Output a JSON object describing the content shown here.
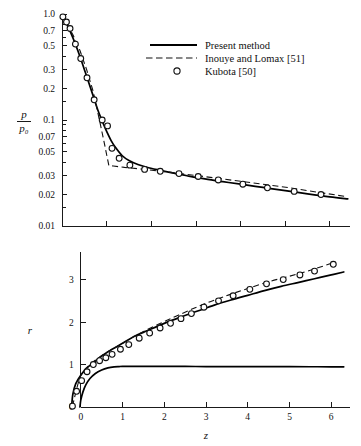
{
  "figure": {
    "legend": {
      "items": [
        {
          "label": "Present method",
          "style": "solid-line"
        },
        {
          "label": "Inouye and Lomax [51]",
          "style": "dashed-line"
        },
        {
          "label": "Kubota [50]",
          "style": "open-circle"
        }
      ]
    }
  },
  "chart_data": [
    {
      "id": "pressure-ratio-chart",
      "type": "line",
      "title": "",
      "xlabel": "",
      "ylabel": "p/p₀",
      "ylabel_numerator": "p",
      "ylabel_denominator": "p₀",
      "xscale": "linear",
      "yscale": "log",
      "xlim": [
        0,
        6.45
      ],
      "ylim": [
        0.01,
        1.0
      ],
      "grid": false,
      "xticks": [
        0,
        1,
        2,
        3,
        4,
        5,
        6
      ],
      "xticklabels": [
        "",
        "",
        "",
        "",
        "",
        "",
        ""
      ],
      "yticks": [
        1.0,
        0.7,
        0.5,
        0.3,
        0.2,
        0.1,
        0.07,
        0.05,
        0.03,
        0.02,
        0.01
      ],
      "yticklabels": [
        "1.0",
        "0.7",
        "0.5",
        "0.3",
        "0.2",
        "0.1",
        "0.07",
        "0.05",
        "0.03",
        "0.02",
        "0.01"
      ],
      "legend_position": "upper-right",
      "series": [
        {
          "name": "Present method",
          "type": "line",
          "style": "solid",
          "x": [
            0.0,
            0.05,
            0.12,
            0.2,
            0.3,
            0.4,
            0.5,
            0.6,
            0.7,
            0.8,
            0.9,
            1.0,
            1.1,
            1.2,
            1.35,
            1.5,
            1.7,
            1.9,
            2.2,
            2.5,
            2.8,
            3.2,
            3.6,
            4.0,
            4.5,
            5.0,
            5.5,
            6.0,
            6.4
          ],
          "y": [
            0.98,
            0.9,
            0.78,
            0.66,
            0.52,
            0.4,
            0.3,
            0.225,
            0.168,
            0.125,
            0.098,
            0.078,
            0.064,
            0.055,
            0.046,
            0.0415,
            0.038,
            0.0358,
            0.0335,
            0.0315,
            0.0298,
            0.0278,
            0.0262,
            0.0248,
            0.0231,
            0.0216,
            0.0201,
            0.0188,
            0.018
          ]
        },
        {
          "name": "Inouye and Lomax [51]",
          "type": "line",
          "style": "dashed",
          "x": [
            0.0,
            0.1,
            0.25,
            0.4,
            0.55,
            0.7,
            0.85,
            0.95,
            1.0,
            1.05,
            1.15,
            1.4,
            1.8,
            2.3,
            2.8,
            3.4,
            4.0,
            4.6,
            5.2,
            5.8,
            6.35
          ],
          "y": [
            0.97,
            0.83,
            0.63,
            0.455,
            0.3,
            0.185,
            0.095,
            0.06,
            0.047,
            0.0372,
            0.0368,
            0.0357,
            0.0344,
            0.0326,
            0.0307,
            0.0285,
            0.0264,
            0.0245,
            0.0226,
            0.0206,
            0.019
          ]
        },
        {
          "name": "Kubota [50]",
          "type": "scatter",
          "style": "open-circle",
          "x": [
            0.02,
            0.1,
            0.18,
            0.3,
            0.42,
            0.56,
            0.72,
            0.9,
            1.02,
            1.12,
            1.28,
            1.52,
            1.85,
            2.2,
            2.62,
            3.05,
            3.5,
            4.05,
            4.6,
            5.2,
            5.8
          ],
          "y": [
            0.94,
            0.84,
            0.73,
            0.52,
            0.38,
            0.25,
            0.155,
            0.1,
            0.088,
            0.054,
            0.0435,
            0.0375,
            0.0342,
            0.0328,
            0.0312,
            0.0293,
            0.0272,
            0.0248,
            0.0229,
            0.0212,
            0.0198
          ]
        }
      ]
    },
    {
      "id": "shock-radius-chart",
      "type": "line",
      "title": "",
      "xlabel": "z",
      "ylabel": "r",
      "xscale": "linear",
      "yscale": "linear",
      "xlim": [
        -0.45,
        6.45
      ],
      "ylim": [
        0,
        3.65
      ],
      "grid": false,
      "xticks": [
        0,
        1,
        2,
        3,
        4,
        5,
        6
      ],
      "xticklabels": [
        "0",
        "1",
        "2",
        "3",
        "4",
        "5",
        "6"
      ],
      "yticks": [
        0,
        1,
        2,
        3
      ],
      "yticklabels": [
        "0",
        "1",
        "2",
        "3"
      ],
      "legend_position": "none",
      "series": [
        {
          "name": "Present method (shock)",
          "type": "line",
          "style": "solid",
          "x": [
            -0.22,
            -0.19,
            -0.12,
            0.0,
            0.15,
            0.3,
            0.5,
            0.75,
            1.0,
            1.3,
            1.6,
            2.0,
            2.4,
            2.8,
            3.2,
            3.6,
            4.0,
            4.4,
            4.8,
            5.2,
            5.6,
            6.0,
            6.3
          ],
          "y": [
            0.0,
            0.3,
            0.55,
            0.75,
            0.92,
            1.04,
            1.2,
            1.36,
            1.5,
            1.67,
            1.8,
            1.97,
            2.12,
            2.26,
            2.4,
            2.52,
            2.63,
            2.74,
            2.84,
            2.93,
            3.02,
            3.11,
            3.18
          ]
        },
        {
          "name": "Present method (body)",
          "type": "line",
          "style": "solid",
          "x": [
            -0.02,
            0.0,
            0.05,
            0.12,
            0.22,
            0.35,
            0.5,
            0.65,
            0.8,
            0.92,
            1.0,
            1.5,
            2.0,
            2.5,
            3.0,
            3.5,
            4.0,
            4.5,
            5.0,
            5.5,
            6.0,
            6.3
          ],
          "y": [
            0.0,
            0.16,
            0.35,
            0.52,
            0.67,
            0.79,
            0.87,
            0.92,
            0.945,
            0.952,
            0.955,
            0.955,
            0.955,
            0.955,
            0.953,
            0.952,
            0.951,
            0.95,
            0.949,
            0.948,
            0.947,
            0.946
          ]
        },
        {
          "name": "Inouye and Lomax [51]",
          "type": "line",
          "style": "dashed",
          "x": [
            -0.2,
            0.0,
            0.25,
            0.55,
            0.9,
            1.3,
            1.75,
            2.2,
            2.65,
            3.1,
            3.55,
            4.0,
            4.5,
            5.0,
            5.5,
            6.05
          ],
          "y": [
            0.02,
            0.74,
            1.02,
            1.24,
            1.44,
            1.67,
            1.9,
            2.1,
            2.3,
            2.48,
            2.64,
            2.79,
            2.95,
            3.08,
            3.22,
            3.4
          ]
        },
        {
          "name": "Kubota [50]",
          "type": "scatter",
          "style": "open-circle",
          "x": [
            -0.2,
            -0.1,
            0.02,
            0.15,
            0.3,
            0.45,
            0.6,
            0.75,
            0.95,
            1.15,
            1.4,
            1.65,
            1.9,
            2.15,
            2.4,
            2.65,
            2.95,
            3.3,
            3.65,
            4.05,
            4.45,
            4.85,
            5.25,
            5.6,
            6.05
          ],
          "y": [
            0.02,
            0.37,
            0.62,
            0.83,
            1.0,
            1.09,
            1.16,
            1.24,
            1.36,
            1.47,
            1.62,
            1.74,
            1.86,
            1.97,
            2.08,
            2.2,
            2.35,
            2.5,
            2.62,
            2.77,
            2.9,
            3.0,
            3.11,
            3.2,
            3.36
          ]
        }
      ]
    }
  ]
}
